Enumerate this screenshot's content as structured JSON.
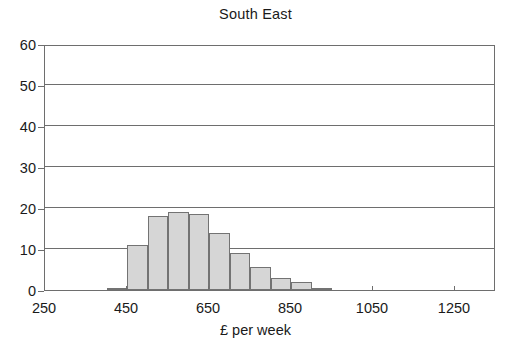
{
  "chart_data": {
    "type": "bar",
    "title": "South East",
    "subtitle": "",
    "xlabel": "£ per week",
    "ylabel": "",
    "grid": true,
    "legend": null,
    "xlim": [
      250,
      1350
    ],
    "ylim": [
      0,
      60
    ],
    "bin_width": 50,
    "x_ticks": [
      250,
      450,
      650,
      850,
      1050,
      1250
    ],
    "x_tick_labels": [
      "250",
      "450",
      "650",
      "850",
      "1050",
      "1250"
    ],
    "y_ticks": [
      0,
      10,
      20,
      30,
      40,
      50,
      60
    ],
    "y_tick_labels": [
      "0",
      "10",
      "20",
      "30",
      "40",
      "50",
      "60"
    ],
    "bins": [
      {
        "start": 400,
        "end": 450,
        "value": 0.5
      },
      {
        "start": 450,
        "end": 500,
        "value": 11
      },
      {
        "start": 500,
        "end": 550,
        "value": 18
      },
      {
        "start": 550,
        "end": 600,
        "value": 19
      },
      {
        "start": 600,
        "end": 650,
        "value": 18.5
      },
      {
        "start": 650,
        "end": 700,
        "value": 14
      },
      {
        "start": 700,
        "end": 750,
        "value": 9
      },
      {
        "start": 750,
        "end": 800,
        "value": 5.5
      },
      {
        "start": 800,
        "end": 850,
        "value": 3
      },
      {
        "start": 850,
        "end": 900,
        "value": 2
      },
      {
        "start": 900,
        "end": 950,
        "value": 0.4
      }
    ],
    "categories": [
      "400-450",
      "450-500",
      "500-550",
      "550-600",
      "600-650",
      "650-700",
      "700-750",
      "750-800",
      "800-850",
      "850-900",
      "900-950"
    ],
    "values": [
      0.5,
      11,
      18,
      19,
      18.5,
      14,
      9,
      5.5,
      3,
      2,
      0.4
    ],
    "colors": {
      "bar_fill": "#d6d6d6",
      "bar_border": "#737373",
      "axis": "#6e6e6e",
      "text": "#1a1a1a",
      "background": "#ffffff"
    }
  }
}
